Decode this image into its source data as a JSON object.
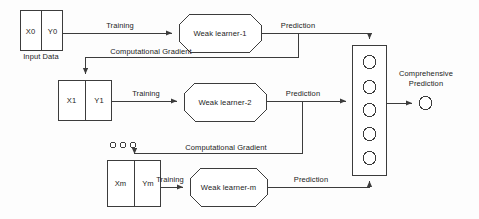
{
  "diagram": {
    "colors": {
      "stroke": "#3c3c3c",
      "text": "#1b1b1b",
      "background": "#fdfdfd",
      "shape_fill": "#ffffff"
    },
    "data_blocks": [
      {
        "id": "block-0",
        "x_label": "X0",
        "y_label": "Y0",
        "caption": "Input Data"
      },
      {
        "id": "block-1",
        "x_label": "X1",
        "y_label": "Y1",
        "caption": ""
      },
      {
        "id": "block-m",
        "x_label": "Xm",
        "y_label": "Ym",
        "caption": ""
      }
    ],
    "learners": [
      {
        "id": "learner-1",
        "label": "Weak learner-1"
      },
      {
        "id": "learner-2",
        "label": "Weak learner-2"
      },
      {
        "id": "learner-m",
        "label": "Weak learner-m"
      }
    ],
    "edges": {
      "training": [
        {
          "id": "training-0",
          "label": "Training"
        },
        {
          "id": "training-1",
          "label": "Training"
        },
        {
          "id": "training-m",
          "label": "Training"
        }
      ],
      "prediction": [
        {
          "id": "prediction-1",
          "label": "Prediction"
        },
        {
          "id": "prediction-2",
          "label": "Prediction"
        },
        {
          "id": "prediction-m",
          "label": "Prediction"
        }
      ],
      "gradient": [
        {
          "id": "gradient-1",
          "label": "Computational Gradient"
        },
        {
          "id": "gradient-2",
          "label": "Computational Gradient"
        }
      ]
    },
    "aggregator": {
      "id": "aggregation-box",
      "node_count": 5
    },
    "output": {
      "label_line1": "Comprehensive",
      "label_line2": "Prediction"
    },
    "ellipsis": {
      "label": "o o o",
      "dot_count": 3
    }
  }
}
